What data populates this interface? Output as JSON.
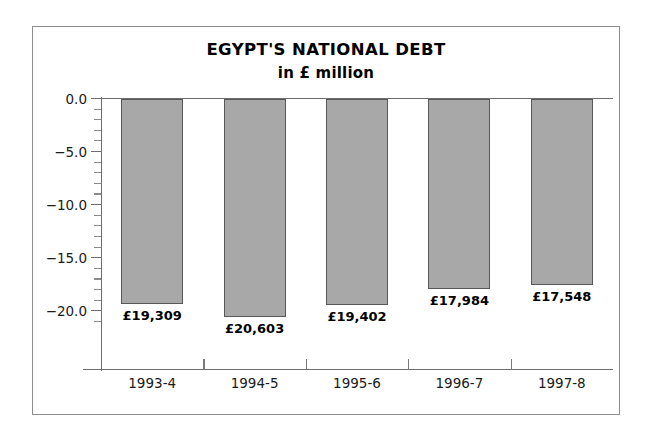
{
  "chart_data": {
    "type": "bar",
    "title": "EGYPT'S NATIONAL DEBT",
    "subtitle": "in £ million",
    "xlabel": "",
    "ylabel": "",
    "orientation": "vertical-negative",
    "grid": false,
    "legend": null,
    "categories": [
      "1993-4",
      "1994-5",
      "1995-6",
      "1996-7",
      "1997-8"
    ],
    "values": [
      -19.309,
      -20.603,
      -19.402,
      -17.984,
      -17.548
    ],
    "value_labels": [
      "£19,309",
      "£20,603",
      "£19,402",
      "£17,984",
      "£17,548"
    ],
    "ylim": [
      -22.0,
      0.0
    ],
    "ytick_values": [
      0.0,
      -5.0,
      -10.0,
      -15.0,
      -20.0
    ],
    "ytick_labels": [
      "0.0",
      "−5.0",
      "−10.0",
      "−15.0",
      "−20.0"
    ],
    "yminor_step": 1.0,
    "colors": {
      "bar_fill": "#a8a8a8",
      "bar_edge": "#585858",
      "axis": "#6e6e6e",
      "text": "#000000",
      "frame": "#8d8d8d",
      "background": "#ffffff"
    }
  }
}
